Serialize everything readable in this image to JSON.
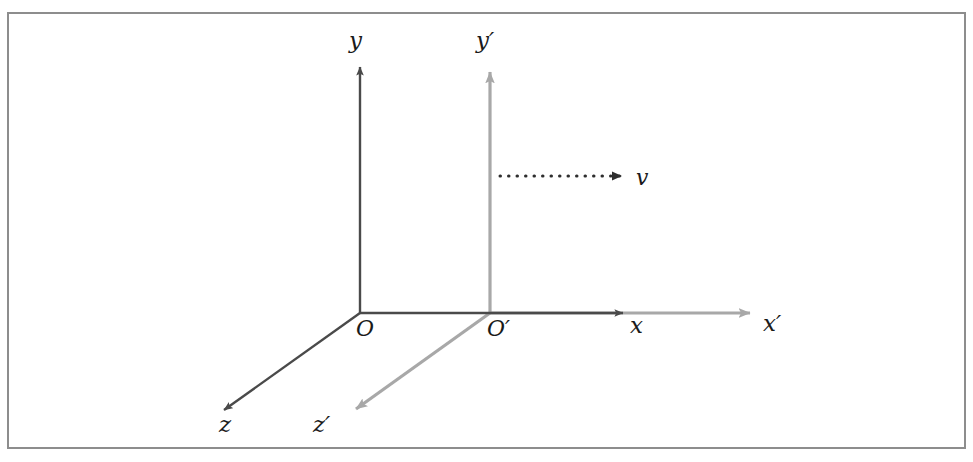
{
  "figure": {
    "background_color": "#ffffff",
    "border": {
      "name": "figure-border",
      "color": "#8d8d8d",
      "x": 8,
      "y": 13,
      "width": 957,
      "height": 435,
      "stroke_width": 2
    },
    "colors": {
      "frame_s": "#4a4a4a",
      "frame_s_prime": "#a8a8a8",
      "velocity": "#2e2e2e",
      "label_text": "#1a1a1a"
    },
    "frames": [
      {
        "id": "frame-s",
        "name": "unprimed-frame",
        "color": "#4a4a4a",
        "origin": {
          "label": "O",
          "x": 360,
          "y": 313
        },
        "axes": [
          {
            "name": "y-axis",
            "label": "y",
            "from": [
              360,
              313
            ],
            "to": [
              360,
              58
            ],
            "label_x": 355,
            "label_y": 48
          },
          {
            "name": "x-axis",
            "label": "x",
            "from": [
              360,
              313
            ],
            "to": [
              630,
              313
            ],
            "label_x": 634,
            "label_y": 330
          },
          {
            "name": "z-axis",
            "label": "z",
            "from": [
              360,
              313
            ],
            "to": [
              216,
              416
            ],
            "label_x": 222,
            "label_y": 431
          }
        ]
      },
      {
        "id": "frame-s-prime",
        "name": "primed-frame",
        "color": "#a8a8a8",
        "origin": {
          "label": "O′",
          "x": 490,
          "y": 313
        },
        "axes": [
          {
            "name": "y-prime-axis",
            "label": "y′",
            "from": [
              490,
              313
            ],
            "to": [
              490,
              58
            ],
            "label_x": 480,
            "label_y": 48
          },
          {
            "name": "x-prime-axis",
            "label": "x′",
            "from": [
              490,
              313
            ],
            "to": [
              763,
              313
            ],
            "label_x": 767,
            "label_y": 330
          },
          {
            "name": "z-prime-axis",
            "label": "z′",
            "from": [
              490,
              313
            ],
            "to": [
              346,
              416
            ],
            "label_x": 330,
            "label_y": 431
          }
        ]
      }
    ],
    "velocity_vector": {
      "name": "velocity-vector",
      "label": "v",
      "style": "dotted",
      "color": "#2e2e2e",
      "from": [
        500,
        176
      ],
      "to": [
        632,
        176
      ],
      "label_x": 640,
      "label_y": 185
    },
    "origin_labels": [
      {
        "name": "origin-label-o",
        "text": "O",
        "x": 356,
        "y": 334
      },
      {
        "name": "origin-label-o-prime",
        "text": "O′",
        "x": 489,
        "y": 334
      }
    ]
  }
}
